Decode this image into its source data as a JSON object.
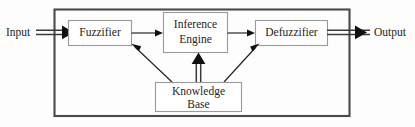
{
  "diagram": {
    "type": "block-flow-diagram",
    "background_color": "#fdfdfd",
    "frame": {
      "name": "fuzzy-system-boundary",
      "stroke_color": "#4a4a4a"
    },
    "io": {
      "input_label": "Input",
      "output_label": "Output"
    },
    "nodes": [
      {
        "id": "fuzzifier",
        "label": "Fuzzifier",
        "lines": [
          "Fuzzifier"
        ]
      },
      {
        "id": "inference-engine",
        "label": "Inference Engine",
        "lines": [
          "Inference",
          "Engine"
        ]
      },
      {
        "id": "defuzzifier",
        "label": "Defuzzifier",
        "lines": [
          "Defuzzifier"
        ]
      },
      {
        "id": "knowledge-base",
        "label": "Knowledge Base",
        "lines": [
          "Knowledge",
          "Base"
        ]
      }
    ],
    "connections": [
      {
        "from": "Input",
        "to": "Fuzzifier",
        "style": "thick-double"
      },
      {
        "from": "Fuzzifier",
        "to": "Inference Engine",
        "style": "thin"
      },
      {
        "from": "Inference Engine",
        "to": "Defuzzifier",
        "style": "thin"
      },
      {
        "from": "Defuzzifier",
        "to": "Output",
        "style": "thick-double"
      },
      {
        "from": "Knowledge Base",
        "to": "Inference Engine",
        "style": "thick-double"
      },
      {
        "from": "Knowledge Base",
        "to": "Fuzzifier",
        "style": "thin-diagonal"
      },
      {
        "from": "Knowledge Base",
        "to": "Defuzzifier",
        "style": "thin-diagonal"
      }
    ],
    "colors": {
      "box_stroke": "#9a9a9a",
      "frame_stroke": "#4a4a4a",
      "arrow": "#111111",
      "text": "#242424"
    }
  }
}
